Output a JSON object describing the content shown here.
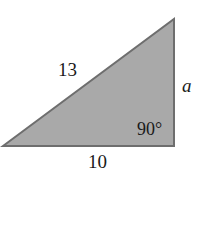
{
  "diagram": {
    "type": "right-triangle",
    "fill_color": "#a9a9a9",
    "stroke_color": "#6e6e6e",
    "hypotenuse_label": "13",
    "vertical_side_label": "a",
    "base_label": "10",
    "right_angle_label": "90°"
  }
}
